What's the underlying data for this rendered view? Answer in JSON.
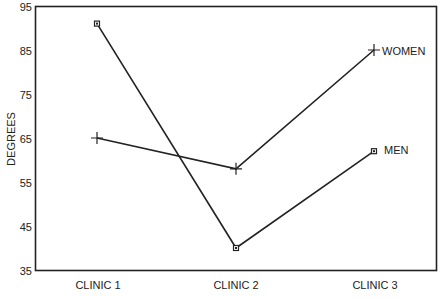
{
  "chart_data": {
    "type": "line",
    "title": "",
    "xlabel": "",
    "ylabel": "DEGREES",
    "categories": [
      "CLINIC 1",
      "CLINIC 2",
      "CLINIC 3"
    ],
    "series": [
      {
        "name": "WOMEN",
        "marker": "plus",
        "values": [
          65,
          58,
          85
        ]
      },
      {
        "name": "MEN",
        "marker": "square",
        "values": [
          91,
          40,
          62
        ]
      }
    ],
    "ylim": [
      35,
      95
    ],
    "yticks": [
      35,
      45,
      55,
      65,
      75,
      85,
      95
    ],
    "grid": false,
    "legend": "inline labels at line ends (right)"
  },
  "axes": {
    "ylabel": "DEGREES",
    "yticks": [
      "35",
      "45",
      "55",
      "65",
      "75",
      "85",
      "95"
    ],
    "xticks": [
      "CLINIC 1",
      "CLINIC 2",
      "CLINIC 3"
    ]
  },
  "labels": {
    "women": "WOMEN",
    "men": "MEN"
  },
  "colors": {
    "line": "#222222",
    "background": "#ffffff"
  }
}
